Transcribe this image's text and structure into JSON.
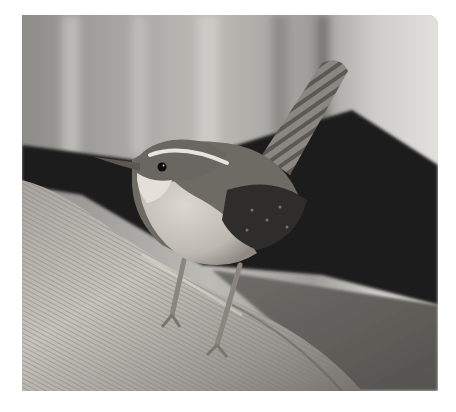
{
  "image": {
    "subject": "Wren perched on a weathered log",
    "description": "Small brown bird with white eyebrow stripe, pale throat and breast, dark barred wings and upright barred tail, standing on a diagonal textured wooden log against a blurred light background with a dark shadowed band",
    "tone": "near-monochrome, slightly warm",
    "colors": {
      "page_background": "#ffffff",
      "background_light": "#b8b6b2",
      "background_mid": "#8f8d89",
      "shadow_band": "#1c1c1b",
      "log_light": "#c9c7c2",
      "log_mid": "#9b9894",
      "bird_back": "#6d6a65",
      "bird_wing": "#2e2c2a",
      "bird_breast": "#cfcac2",
      "eyebrow": "#e6e3dd",
      "eye": "#0d0d0d"
    }
  }
}
